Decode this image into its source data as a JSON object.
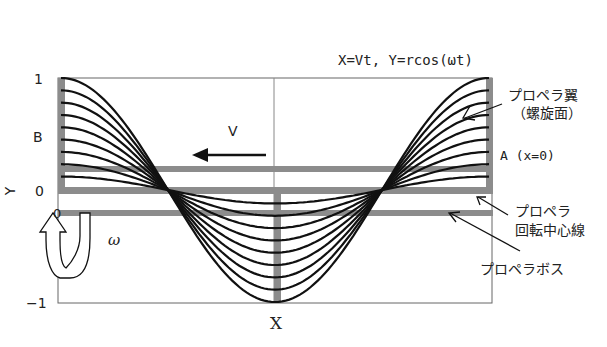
{
  "diagram": {
    "equation": "X=Vt,  Y=rcos(ωt)",
    "axes": {
      "ylabel": "Y",
      "xlabel": "X",
      "yticks": [
        "1",
        "0",
        "−1"
      ],
      "y_origin_label": "0"
    },
    "labels": {
      "B": "B",
      "A": "A (x=0)",
      "V": "V",
      "omega": "ω",
      "blade_line1": "プロペラ翼",
      "blade_line2": "（螺旋面）",
      "axis_line1": "プロペラ",
      "axis_line2": "回転中心線",
      "boss": "プロペラボス"
    },
    "colors": {
      "curve": "#111111",
      "bar": "#8c8c8c",
      "frame": "#555555",
      "text": "#222222"
    },
    "curves": {
      "count": 9,
      "amplitudes": [
        1.0,
        0.89,
        0.78,
        0.67,
        0.56,
        0.45,
        0.34,
        0.23,
        0.12
      ],
      "function": "Y = r·cos(ωt)"
    }
  }
}
